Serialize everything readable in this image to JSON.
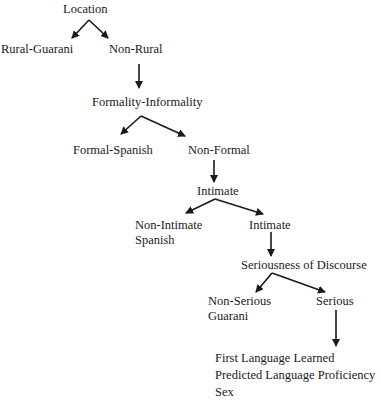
{
  "diagram": {
    "type": "decision-tree",
    "nodes": {
      "location": "Location",
      "rural_guarani": "Rural-Guarani",
      "non_rural": "Non-Rural",
      "formality": "Formality-Informality",
      "formal_spanish": "Formal-Spanish",
      "non_formal": "Non-Formal",
      "intimate_q": "Intimate",
      "non_intimate_line1": "Non-Intimate",
      "non_intimate_line2": "Spanish",
      "intimate": "Intimate",
      "seriousness": "Seriousness of Discourse",
      "non_serious_line1": "Non-Serious",
      "non_serious_line2": "Guarani",
      "serious": "Serious",
      "final_line1": "First Language Learned",
      "final_line2": "Predicted Language Proficiency",
      "final_line3": "Sex"
    },
    "edges": [
      [
        "Location",
        "Rural-Guarani"
      ],
      [
        "Location",
        "Non-Rural"
      ],
      [
        "Non-Rural",
        "Formality-Informality"
      ],
      [
        "Formality-Informality",
        "Formal-Spanish"
      ],
      [
        "Formality-Informality",
        "Non-Formal"
      ],
      [
        "Non-Formal",
        "Intimate"
      ],
      [
        "Intimate",
        "Non-Intimate Spanish"
      ],
      [
        "Intimate",
        "Intimate (branch)"
      ],
      [
        "Intimate (branch)",
        "Seriousness of Discourse"
      ],
      [
        "Seriousness of Discourse",
        "Non-Serious Guarani"
      ],
      [
        "Seriousness of Discourse",
        "Serious"
      ],
      [
        "Serious",
        "First Language Learned / Predicted Language Proficiency / Sex"
      ]
    ]
  }
}
